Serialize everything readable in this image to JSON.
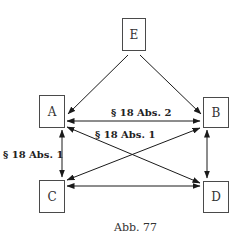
{
  "diagram": {
    "nodes": {
      "E": {
        "label": "E"
      },
      "A": {
        "label": "A"
      },
      "B": {
        "label": "B"
      },
      "C": {
        "label": "C"
      },
      "D": {
        "label": "D"
      }
    },
    "edges": [
      {
        "from": "E",
        "to": "A",
        "direction": "forward",
        "label": ""
      },
      {
        "from": "E",
        "to": "B",
        "direction": "forward",
        "label": ""
      },
      {
        "from": "A",
        "to": "B",
        "direction": "both",
        "label": "§ 18 Abs. 2"
      },
      {
        "from": "A",
        "to": "D",
        "direction": "both",
        "label": "§ 18 Abs. 1"
      },
      {
        "from": "B",
        "to": "C",
        "direction": "both",
        "label": ""
      },
      {
        "from": "A",
        "to": "C",
        "direction": "both",
        "label": "§ 18 Abs. 1"
      },
      {
        "from": "B",
        "to": "D",
        "direction": "both",
        "label": ""
      },
      {
        "from": "C",
        "to": "D",
        "direction": "both",
        "label": ""
      }
    ],
    "labels": {
      "ab": "§ 18 Abs. 2",
      "ad": "§ 18 Abs. 1",
      "ac": "§ 18 Abs. 1"
    },
    "caption": "Abb. 77"
  }
}
